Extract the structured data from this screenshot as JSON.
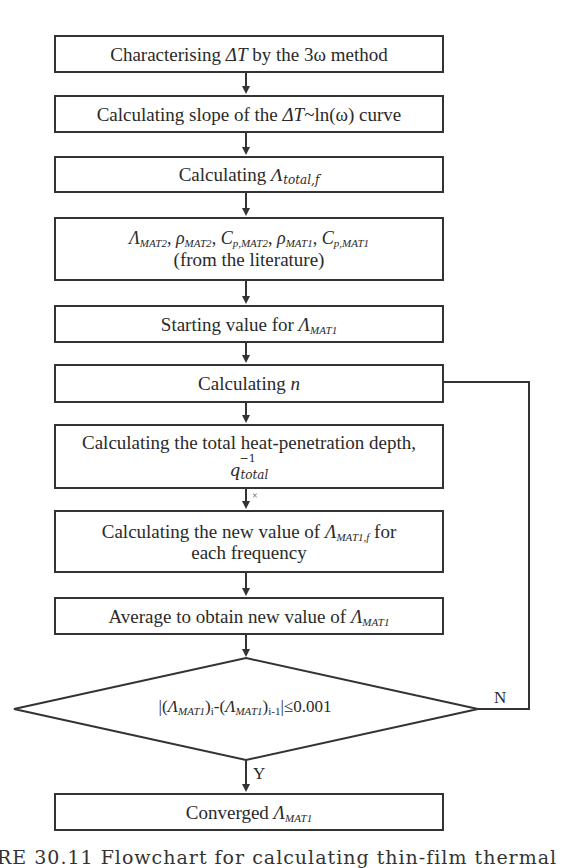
{
  "flowchart": {
    "steps": [
      {
        "id": "step1",
        "pre": "Characterising ",
        "sym": "ΔT",
        "post": " by the 3ω method"
      },
      {
        "id": "step2",
        "pre": "Calculating slope of the ",
        "sym": "ΔT",
        "post": "~ln(ω) curve"
      },
      {
        "id": "step3",
        "pre": "Calculating ",
        "sym": "Λ",
        "sub": "total,f"
      },
      {
        "id": "step4",
        "params": [
          {
            "sym": "Λ",
            "sub": "MAT2"
          },
          {
            "sym": "ρ",
            "sub": "MAT2"
          },
          {
            "sym": "C",
            "sub": "p,MAT2"
          },
          {
            "sym": "ρ",
            "sub": "MAT1"
          },
          {
            "sym": "C",
            "sub": "p,MAT1"
          }
        ],
        "separator": ", ",
        "line2": "(from the literature)"
      },
      {
        "id": "step5",
        "pre": "Starting value for ",
        "sym": "Λ",
        "sub": "MAT1"
      },
      {
        "id": "step6",
        "pre": "Calculating ",
        "sym": "n"
      },
      {
        "id": "step7",
        "line1": "Calculating the total heat-penetration depth,",
        "sym": "q",
        "sup": "−1",
        "sub": "total"
      },
      {
        "id": "step8",
        "pre": "Calculating the new value of ",
        "sym": "Λ",
        "sub": "MAT1,f",
        "post": " for",
        "line2": "each frequency"
      },
      {
        "id": "step9",
        "pre": "Average to obtain new value of ",
        "sym": "Λ",
        "sub": "MAT1"
      },
      {
        "id": "final",
        "pre": "Converged ",
        "sym": "Λ",
        "sub": "MAT1"
      }
    ],
    "decision": {
      "open": "|(",
      "sym1": "Λ",
      "sub1": "MAT1",
      "mid": ")",
      "i": "i",
      "dash": "-(",
      "sym2": "Λ",
      "sub2": "MAT1",
      "close": ")",
      "im1": "i-1",
      "cond": "|≤0.001"
    },
    "yes_label": "Y",
    "no_label": "N",
    "stray_mark": "×"
  },
  "caption": "URE 30.11   Flowchart for calculating thin-film thermal"
}
